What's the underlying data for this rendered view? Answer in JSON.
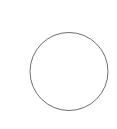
{
  "canvas": {
    "width": 117,
    "height": 129,
    "background_color": "#ffffff",
    "description": "Blank white canvas containing a single thin gray circle outline"
  },
  "shapes": [
    {
      "name": "circle-outline",
      "type": "circle",
      "center_x": 69,
      "center_y": 71.5,
      "radius": 39,
      "diameter": 78,
      "stroke_color": "#6e6e73",
      "stroke_width": 1,
      "fill": "none",
      "label": ""
    }
  ],
  "text": {
    "none_present": ""
  }
}
